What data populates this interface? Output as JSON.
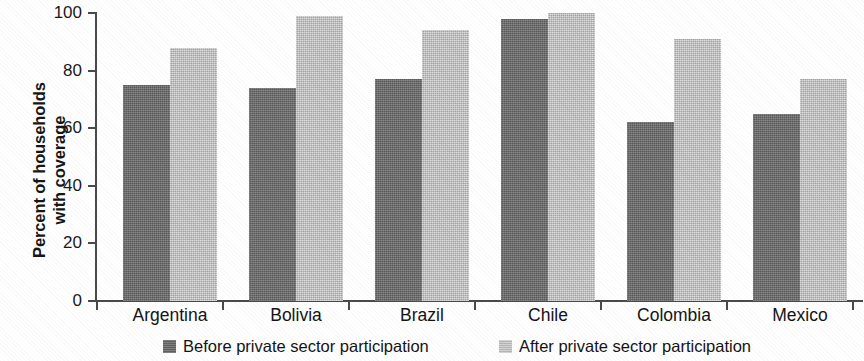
{
  "chart_data": {
    "type": "bar",
    "title": "",
    "subtitle": "",
    "xlabel": "",
    "ylabel": "Percent of households\nwith coverage",
    "ylim": [
      0,
      100
    ],
    "yticks": [
      0,
      20,
      40,
      60,
      80,
      100
    ],
    "ytick_labels": [
      "0",
      "20",
      "40",
      "60",
      "80",
      "100"
    ],
    "grid": false,
    "legend_position": "bottom",
    "categories": [
      "Argentina",
      "Bolivia",
      "Brazil",
      "Chile",
      "Colombia",
      "Mexico"
    ],
    "series": [
      {
        "name": "Before private sector participation",
        "color": "#6e6e6e",
        "values": [
          75,
          74,
          77,
          98,
          62,
          65
        ]
      },
      {
        "name": "After private sector participation",
        "color": "#c9c9c9",
        "values": [
          88,
          99,
          94,
          100,
          91,
          77
        ]
      }
    ]
  },
  "legend": {
    "items": [
      {
        "label": "Before private sector participation",
        "swatch": "dark-gray-square"
      },
      {
        "label": "After private sector participation",
        "swatch": "light-gray-square"
      }
    ]
  }
}
